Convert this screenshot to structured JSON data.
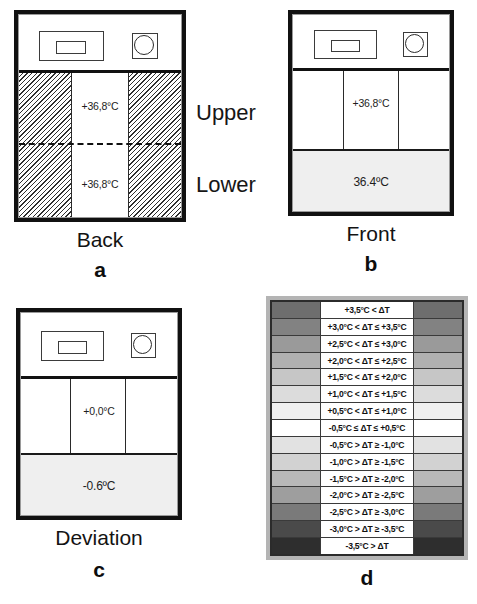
{
  "figure": {
    "side_labels": {
      "upper": "Upper",
      "lower": "Lower"
    }
  },
  "panels": [
    {
      "letter": "a",
      "caption": "Back",
      "view": "back",
      "upper_temp": "+36,8°C",
      "lower_temp": "+36,8°C"
    },
    {
      "letter": "b",
      "caption": "Front",
      "view": "front",
      "upper_temp": "+36,8°C",
      "lower_temp": "36.4ºC"
    },
    {
      "letter": "c",
      "caption": "Deviation",
      "view": "deviation",
      "upper_temp": "+0,0°C",
      "lower_temp": "-0.6ºC"
    },
    {
      "letter": "d",
      "caption": "",
      "view": "legend"
    }
  ],
  "legend": {
    "rows": [
      {
        "label": "+3,5°C < ΔT",
        "color": "#6e6e6e"
      },
      {
        "label": "+3,0°C < ΔT ≤ +3,5°C",
        "color": "#828282"
      },
      {
        "label": "+2,5°C < ΔT ≤ +3,0°C",
        "color": "#9a9a9a"
      },
      {
        "label": "+2,0°C < ΔT ≤ +2,5°C",
        "color": "#b0b0b0"
      },
      {
        "label": "+1,5°C < ΔT ≤ +2,0°C",
        "color": "#c6c6c6"
      },
      {
        "label": "+1,0°C < ΔT ≤ +1,5°C",
        "color": "#dcdcdc"
      },
      {
        "label": "+0,5°C < ΔT ≤ +1,0°C",
        "color": "#f0f0f0"
      },
      {
        "label": "-0,5°C ≤  ΔT ≤ +0,5°C",
        "color": "#ffffff"
      },
      {
        "label": "-0,5°C > ΔT ≥ -1,0°C",
        "color": "#e2e2e2"
      },
      {
        "label": "-1,0°C > ΔT ≥ -1,5°C",
        "color": "#d2d2d2"
      },
      {
        "label": "-1,5°C > ΔT ≥ -2,0°C",
        "color": "#b8b8b8"
      },
      {
        "label": "-2,0°C > ΔT ≥ -2,5°C",
        "color": "#9e9e9e"
      },
      {
        "label": "-2,5°C > ΔT ≥ -3,0°C",
        "color": "#7a7a7a"
      },
      {
        "label": "-3,0°C > ΔT ≥ -3,5°C",
        "color": "#4a4a4a"
      },
      {
        "label": "-3,5°C > ΔT",
        "color": "#2e2e2e"
      }
    ]
  }
}
